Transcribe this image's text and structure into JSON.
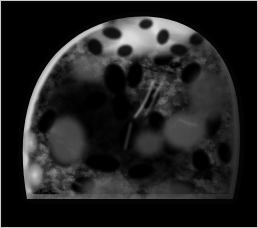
{
  "viewer": {
    "width": 258,
    "height": 228,
    "background_color": "#ffffff",
    "frame_border_color": "#c9c9c9",
    "plate_color": "#000000"
  },
  "image": {
    "kind": "grayscale-cross-section",
    "modality_appearance": "monochrome radiographic / micro-tomographic slice",
    "subject": "rounded dome-shaped biological specimen cross-section",
    "orientation": "flat edge at bottom, domed top",
    "background_color": "#000000",
    "has_color": false,
    "visible_text": "",
    "annotations": [],
    "scale_bar": "",
    "labels": []
  },
  "palette": {
    "black": "#000000",
    "near_black": "#080808",
    "deep_shadow": "#141414",
    "dark_gray": "#2a2a2a",
    "mid_dark": "#3d3d3d",
    "mid_gray": "#5a5a5a",
    "gray": "#777777",
    "light_gray": "#9a9a9a",
    "pale": "#bdbdbd",
    "bright": "#dcdcdc",
    "highlight": "#f2f2f2",
    "white": "#ffffff"
  },
  "specimen": {
    "bounding_box": {
      "x": 14,
      "y": 8,
      "width": 226,
      "height": 200
    },
    "silhouette_path": "M 24 196 C 16 150 18 104 40 68 C 62 32 104 10 150 14 C 196 18 226 50 234 96 C 240 134 236 170 230 196 Z",
    "rim": {
      "description": "bright cortical rim following the left, top and right outline",
      "left_rim_color": "#d8d8d8",
      "top_rim_color": "#f4f4f4",
      "right_rim_color": "#8d8d8d",
      "bottom_rim_color": "#9c9c9c"
    },
    "interior": {
      "description": "mottled marbled trabecular interior, mostly very dark with irregular mid-gray patches and black voids",
      "dominant_tone": "#121212",
      "patch_tone": "#5c5c5c"
    },
    "bright_cap": {
      "description": "large high-intensity lobed region across the top of the dome",
      "center_x": 150,
      "center_y": 32,
      "peak_color": "#ffffff"
    },
    "dark_core": {
      "description": "broad dark hollow occupying the centre-left of the section",
      "center_x": 100,
      "center_y": 120
    }
  }
}
